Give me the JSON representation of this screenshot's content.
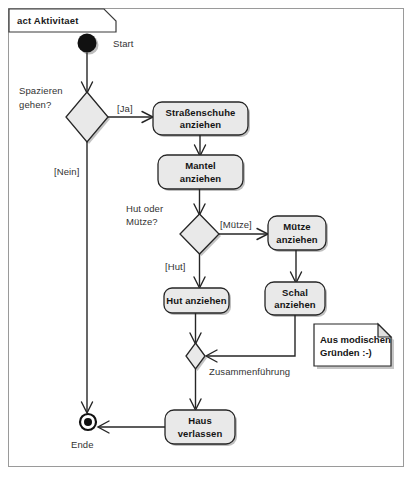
{
  "frame": {
    "tab_label": "act Aktivitaet",
    "border_color": "#9a9a9a",
    "background": "#ffffff"
  },
  "theme": {
    "node_fill": "#e9e9e9",
    "node_stroke": "#262626",
    "shadow": "#b4b4b4",
    "text": "#141414",
    "label_text": "#333333"
  },
  "diagram": {
    "type": "uml-activity-diagram",
    "title": "act Aktivitaet",
    "nodes": [
      {
        "id": "start",
        "kind": "initial-node",
        "label": "Start",
        "x": 87,
        "y": 43
      },
      {
        "id": "decision_spazieren",
        "kind": "decision-node",
        "label": "Spazieren gehen?",
        "label_line1": "Spazieren",
        "label_line2": "gehen?",
        "x": 87,
        "y": 117
      },
      {
        "id": "strassenschuhe",
        "kind": "action-node",
        "label": "Straßenschuhe anziehen",
        "label_line1": "Straßenschuhe",
        "label_line2": "anziehen",
        "x": 200,
        "y": 118
      },
      {
        "id": "mantel",
        "kind": "action-node",
        "label": "Mantel anziehen",
        "label_line1": "Mantel",
        "label_line2": "anziehen",
        "x": 200,
        "y": 172
      },
      {
        "id": "decision_hut_muetze",
        "kind": "decision-node",
        "label": "Hut oder Mütze?",
        "label_line1": "Hut oder",
        "label_line2": "Mütze?",
        "x": 199,
        "y": 234
      },
      {
        "id": "muetze",
        "kind": "action-node",
        "label": "Mütze anziehen",
        "label_line1": "Mütze",
        "label_line2": "anziehen",
        "x": 297,
        "y": 233
      },
      {
        "id": "schal",
        "kind": "action-node",
        "label": "Schal anziehen",
        "label_line1": "Schal",
        "label_line2": "anziehen",
        "x": 295,
        "y": 298
      },
      {
        "id": "hut",
        "kind": "action-node",
        "label": "Hut anziehen",
        "label_line1": "Hut anziehen",
        "label_line2": "",
        "x": 196,
        "y": 300
      },
      {
        "id": "merge",
        "kind": "merge-node",
        "label": "Zusammenführung",
        "x": 195,
        "y": 356
      },
      {
        "id": "haus_verlassen",
        "kind": "action-node",
        "label": "Haus verlassen",
        "label_line1": "Haus",
        "label_line2": "verlassen",
        "x": 200,
        "y": 427
      },
      {
        "id": "end",
        "kind": "final-node",
        "label": "Ende",
        "x": 88,
        "y": 422
      }
    ],
    "edges": [
      {
        "from": "start",
        "to": "decision_spazieren",
        "guard": ""
      },
      {
        "from": "decision_spazieren",
        "to": "strassenschuhe",
        "guard": "[Ja]"
      },
      {
        "from": "decision_spazieren",
        "to": "end",
        "guard": "[Nein]"
      },
      {
        "from": "strassenschuhe",
        "to": "mantel",
        "guard": ""
      },
      {
        "from": "mantel",
        "to": "decision_hut_muetze",
        "guard": ""
      },
      {
        "from": "decision_hut_muetze",
        "to": "muetze",
        "guard": "[Mütze]"
      },
      {
        "from": "decision_hut_muetze",
        "to": "hut",
        "guard": "[Hut]"
      },
      {
        "from": "muetze",
        "to": "schal",
        "guard": ""
      },
      {
        "from": "schal",
        "to": "merge",
        "guard": ""
      },
      {
        "from": "hut",
        "to": "merge",
        "guard": ""
      },
      {
        "from": "merge",
        "to": "haus_verlassen",
        "guard": ""
      },
      {
        "from": "haus_verlassen",
        "to": "end",
        "guard": ""
      }
    ],
    "guards": {
      "ja": "[Ja]",
      "nein": "[Nein]",
      "muetze": "[Mütze]",
      "hut": "[Hut]"
    },
    "notes": [
      {
        "id": "note_mode",
        "text": "Aus modischen Gründen :-)",
        "line1": "Aus modischen",
        "line2": "Gründen :-)",
        "attached_to": "schal",
        "x": 314,
        "y": 324
      }
    ]
  }
}
